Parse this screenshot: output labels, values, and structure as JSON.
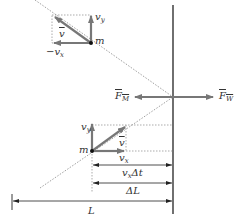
{
  "diagram": {
    "type": "physics-momentum-wall",
    "colors": {
      "vector": "#777777",
      "line": "#222222",
      "dotted": "#888888",
      "text": "#333333"
    },
    "labels": {
      "upper_vy": "v",
      "upper_vy_sub": "y",
      "upper_v": "v",
      "upper_m": "m",
      "upper_minus_vx": "−v",
      "upper_minus_vx_sub": "x",
      "force_m": "F",
      "force_m_sub": "M",
      "force_w": "F",
      "force_w_sub": "W",
      "lower_vy": "v",
      "lower_vy_sub": "y",
      "lower_v": "v",
      "lower_m": "m",
      "lower_vx": "v",
      "lower_vx_sub": "x",
      "dim_vx_dt": "v",
      "dim_vx_dt_sub": "x",
      "dim_vx_dt_rest": "Δt",
      "dim_dL": "ΔL",
      "dim_L": "L"
    }
  }
}
